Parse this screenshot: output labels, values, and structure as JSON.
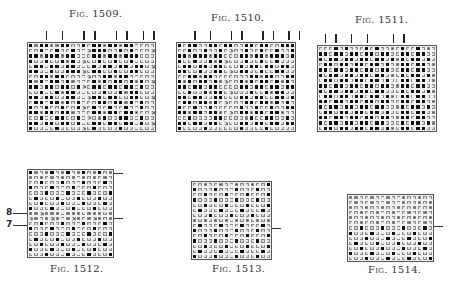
{
  "figures": [
    {
      "id": "1509",
      "caption": "Fig. 1509.",
      "caption_prefix": "Fig.",
      "caption_number": "1509.",
      "columns": 24,
      "rows": [
        "BDBBDDBBOOBOBBDBBDBBOOOO",
        "OOBOOBOOBOOXBBBOOBOBOOOX",
        "BBDBBBDBBOOOBBDBBDBBBOOO",
        "BOOBOOBDBOXOOBOOBOOBOOOO",
        "OBBOBBOBBOOOBOBBOBBOBBOX",
        "BBOOBOOBBBXOBBOOBOOBBOOO",
        "OOBBDBBOOOOXOOBBDBBOOOOO",
        "BDBOBBOBDOOOBDBOBBOBDBOX",
        "BBOBBOBBOBXOBBOBBOBBOBOO",
        "OOBOOBDBBOOOOOBOOBDBBOOO",
        "BBOBBOOBBOOXBBOBBOOBBOOX",
        "OBBOBBDBOBOOOBBOBBDBOBOO",
        "BOOBOOBOOBXOBOOBOOBOOBOO",
        "BBDBBOBBDOOOBBDBBOBBDOOX",
        "OOBOOBBOOBOXODBOOBBOOBOO",
        "BBOBBOBBOBOOBBOBBOBBOBOX",
        "BOOOOBOOOOXOBOOOOBOOOOOO"
      ],
      "top_ticks_count": 8
    },
    {
      "id": "1510",
      "caption": "Fig. 1510.",
      "caption_prefix": "Fig.",
      "caption_number": "1510.",
      "columns": 23,
      "rows": [
        "BOBBOOBBOBBOOBBOBBOOBBB",
        "OOBOOBOOBOXOOBOOBOOBOOB",
        "BBDBBBDBBOOOBBDBBDBBBOB",
        "BOOBOOBDBXOOOBOOBOOBOOO",
        "OBBOBBOBBOOOBOBBOBBOBBO",
        "BBOOBOOBBOXOBBOOBOOBBOO",
        "OOBBDBBOOOOOOOBBDBBOOBB",
        "BDBOBBOBDXOOBDBOBBOBDBO",
        "BBOBBOBBOOOOBBOBBOBBOBB",
        "OOBOOBDBBOXOOOBOOBDBBOO",
        "BBOBBOOBBOOOBBOBBOOBBOB",
        "OBBOBBDBOXOOOBBOBBDBOBO",
        "BOOBOOBOOOOOBOOBOOBOOBB",
        "BBDBBOBBDOXOBBDBBOBBDOO",
        "OOBOOOOBBOOOODBOOBBOOBO",
        "BBOBBOBBOXOOBBOBBOBBOBB",
        "BOOOOBOOOOOOBOOOOBOOOOO"
      ],
      "top_ticks_count": 8
    },
    {
      "id": "1511",
      "caption": "Fig. 1511.",
      "caption_prefix": "Fig.",
      "caption_number": "1511.",
      "columns": 23,
      "rows": [
        "OOOBOBOOOBOBOODOBOOBODO",
        "BBOBBOBBOBBOBBOOBBOBBOO",
        "BOBBOBBOBBOBBOBDBOBBOBO",
        "OBBOBBOBBOBBOBODBBOBBOD",
        "BBOBBOBBOBBOBBOOBBOBBOO",
        "BOBBOBBOBBOBBODOBOBBOBD",
        "OBBOBBOBBOBBOBOOBBOBBOD",
        "BBOBBOBBOBBOBBODBBOBBOO",
        "BOBBOBBOBBOBBOOOBOBBOBD",
        "OBBOBBOBBOBBOBDOBBOBBOO",
        "BBOBBOBBOBBOBBOOBBOBBOD",
        "BOBBOBBOBBOBBOODBOBBOBO",
        "OBBOBBOBBOBBOBOOBBOBBOD",
        "BBOBBOBBOBBOBBODBBOBBOO",
        "BOBBOBBOBBOBBOOOBOBBOBD",
        "OBBOBBOBBOBBOBDOBBOBBOO"
      ],
      "top_ticks_count": 6
    },
    {
      "id": "1512",
      "caption": "Fig. 1512.",
      "caption_prefix": "Fig.",
      "caption_number": "1512.",
      "columns": 16,
      "rows": [
        "BDODBODBODBODBOD",
        "DODODODODODODODO",
        "OOBOOOBOOOBOOOBO",
        "BOOOBOOOBOOOBOOO",
        "OOOBOOOBOOOBOOOB",
        "OBOOOBOOOBOOOBOO",
        "OOBOOOBOOOBOOOBO",
        "BOOOBOOOBOOOBOOO",
        "DDXDDDODDDODDDOD",
        "XDODXDODXDODXDOD",
        "OOBOOOBOOOBOOOBO",
        "BOOOBOOOBOOOBOOO",
        "OOOBOOOBOOOBOOOB",
        "OBOOOBOOOBOOOBOO",
        "OOBOOOBOOOBOOOBO",
        "BOOOBOOOBOOOBOOO",
        "OOOBOOOBOOOBOOOB"
      ],
      "side_labels": [
        "8",
        "7"
      ],
      "right_ticks_count": 2
    },
    {
      "id": "1513",
      "caption": "Fig. 1513.",
      "caption_prefix": "Fig.",
      "caption_number": "1513.",
      "columns": 15,
      "rows": [
        "OODOODOODOODOOB",
        "BOOOBOOOBOOOBOO",
        "OOBOOOBOOOBOOOB",
        "BOOOBOOOBOOOBOO",
        "OOBOOOBOOOBOOOB",
        "OBOOOBOOOBOOOBO",
        "OOOBOOOBOOOBOOO",
        "DODODODODODODOD",
        "OBOOOBOOOBOOOBO",
        "BOOOBOOOBOOOBOO",
        "OOBOOOBOOOBOOOB",
        "BOOOBOOOBOOOBOO",
        "OOBOOOBOOOBOOOB",
        "OBOOOBOOOBOOOBO",
        "BOOOBOOOBOOOBOO"
      ],
      "right_ticks_count": 1
    },
    {
      "id": "1514",
      "caption": "Fig. 1514.",
      "caption_prefix": "Fig.",
      "caption_number": "1514.",
      "columns": 16,
      "rows": [
        "DDOODOODOODOODOO",
        "ODOODOODOODOODOD",
        "DOODOODOODOODOOD",
        "OODOODOODOODOODO",
        "DOODOODOODOODOOD",
        "OODOODOODOODOODO",
        "OOBOOOBOOOBOOOBO",
        "BOOOBOOOBOOOBOOO",
        "OOOBOOOBOOOBOOOB",
        "OBOOOBOOOBOOOBOO",
        "OOBOOOBOOOBOOOBO",
        "BOOOBOOOBOOOBOOO",
        "OOOBOOOBOOOBOOOB"
      ],
      "right_ticks_count": 1
    }
  ],
  "legend_cell_types": {
    "B": "filled-square",
    "O": "open-circle",
    "D": "dot-mark",
    "X": "cross-mark"
  }
}
